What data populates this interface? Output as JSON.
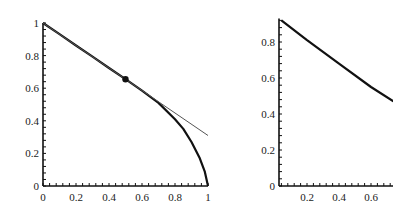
{
  "chart_data": [
    {
      "type": "line",
      "title": "",
      "xlabel": "",
      "ylabel": "",
      "xlim": [
        0,
        1
      ],
      "ylim": [
        0,
        1
      ],
      "grid": false,
      "xticks": [
        "0",
        "0.2",
        "0.4",
        "0.6",
        "0.8",
        "1"
      ],
      "yticks": [
        "0",
        "0.2",
        "0.4",
        "0.6",
        "0.8",
        "1"
      ],
      "series": [
        {
          "name": "curve",
          "style": "thick",
          "x": [
            0,
            0.1,
            0.2,
            0.3,
            0.4,
            0.5,
            0.6,
            0.7,
            0.8,
            0.85,
            0.9,
            0.95,
            0.98,
            1.0
          ],
          "y": [
            1.0,
            0.931,
            0.862,
            0.793,
            0.724,
            0.655,
            0.585,
            0.51,
            0.41,
            0.35,
            0.27,
            0.17,
            0.09,
            0.0
          ]
        },
        {
          "name": "tangent line",
          "style": "thin",
          "x": [
            0,
            1
          ],
          "y": [
            1.0,
            0.31
          ]
        }
      ],
      "points": [
        {
          "name": "marked point",
          "x": 0.5,
          "y": 0.655
        }
      ]
    },
    {
      "type": "line",
      "title": "",
      "xlabel": "",
      "ylabel": "",
      "xlim": [
        0.025,
        0.74
      ],
      "ylim": [
        0,
        0.93
      ],
      "grid": false,
      "xticks": [
        "0.2",
        "0.4",
        "0.6"
      ],
      "yticks": [
        "0",
        "0.2",
        "0.4",
        "0.6",
        "0.8"
      ],
      "series": [
        {
          "name": "curve (zoomed)",
          "style": "thick",
          "x": [
            0.04,
            0.2,
            0.4,
            0.6,
            0.74
          ],
          "y": [
            0.92,
            0.81,
            0.68,
            0.55,
            0.47
          ]
        }
      ]
    }
  ]
}
